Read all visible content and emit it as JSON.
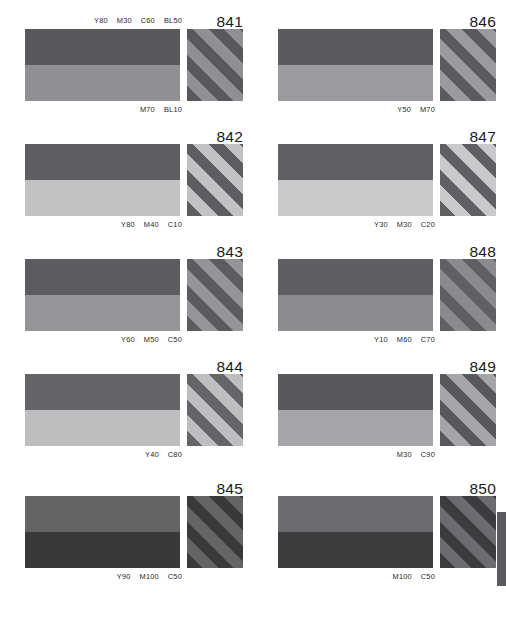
{
  "page": {
    "kind": "color-reference-chart",
    "background": "#ffffff"
  },
  "swatches": [
    {
      "number": "841",
      "spec_top": [
        "Y80",
        "M30",
        "C60",
        "BL50"
      ],
      "spec_bottom": [
        "M70",
        "BL10"
      ],
      "top_color": "#58595c",
      "bottom_color": "#8f9093",
      "stripe_a": "#8f9093",
      "stripe_b": "#58595c"
    },
    {
      "number": "842",
      "spec_top": [],
      "spec_bottom": [
        "Y80",
        "M40",
        "C10"
      ],
      "top_color": "#5d5e61",
      "bottom_color": "#c2c2c4",
      "stripe_a": "#c2c2c4",
      "stripe_b": "#5d5e61"
    },
    {
      "number": "843",
      "spec_top": [],
      "spec_bottom": [
        "Y60",
        "M50",
        "C50"
      ],
      "top_color": "#5b5c5f",
      "bottom_color": "#949598",
      "stripe_a": "#949598",
      "stripe_b": "#5b5c5f"
    },
    {
      "number": "844",
      "spec_top": [],
      "spec_bottom": [
        "Y40",
        "C80"
      ],
      "top_color": "#646568",
      "bottom_color": "#bdbec0",
      "stripe_a": "#bdbec0",
      "stripe_b": "#646568"
    },
    {
      "number": "845",
      "spec_top": [],
      "spec_bottom": [
        "Y90",
        "M100",
        "C50"
      ],
      "top_color": "#636466",
      "bottom_color": "#39393b",
      "stripe_a": "#636466",
      "stripe_b": "#39393b"
    },
    {
      "number": "846",
      "spec_top": [],
      "spec_bottom": [
        "Y50",
        "M70"
      ],
      "top_color": "#5a5b5e",
      "bottom_color": "#9a9b9e",
      "stripe_a": "#9a9b9e",
      "stripe_b": "#5a5b5e"
    },
    {
      "number": "847",
      "spec_top": [],
      "spec_bottom": [
        "Y30",
        "M30",
        "C20"
      ],
      "top_color": "#5f6063",
      "bottom_color": "#c8c9cb",
      "stripe_a": "#c8c9cb",
      "stripe_b": "#5f6063"
    },
    {
      "number": "848",
      "spec_top": [],
      "spec_bottom": [
        "Y10",
        "M60",
        "C70"
      ],
      "top_color": "#5e5f62",
      "bottom_color": "#8a8b8e",
      "stripe_a": "#8a8b8e",
      "stripe_b": "#5e5f62"
    },
    {
      "number": "849",
      "spec_top": [],
      "spec_bottom": [
        "M30",
        "C90"
      ],
      "top_color": "#58595c",
      "bottom_color": "#a5a6a9",
      "stripe_a": "#a5a6a9",
      "stripe_b": "#58595c"
    },
    {
      "number": "850",
      "spec_top": [],
      "spec_bottom": [
        "M100",
        "C50"
      ],
      "top_color": "#6b6c6f",
      "bottom_color": "#3c3c3e",
      "stripe_a": "#6b6c6f",
      "stripe_b": "#3c3c3e"
    }
  ],
  "edge_sliver": {
    "color": "#5a5b5e"
  }
}
